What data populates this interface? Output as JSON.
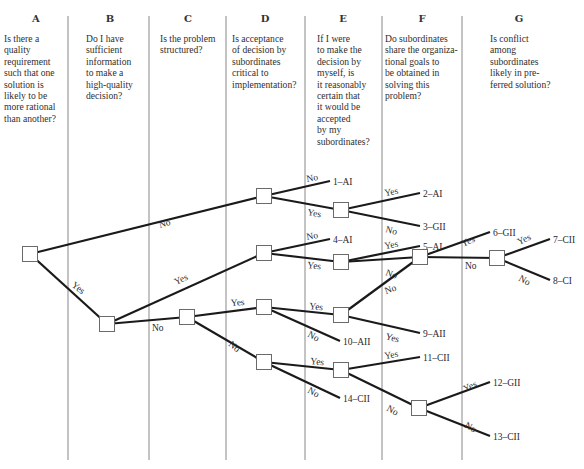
{
  "columns": [
    {
      "letter": "A",
      "question": "Is there a\nquality\nrequirement\nsuch that one\nsolution is\nlikely to be\nmore rational\nthan another?",
      "x": 4,
      "w": 64,
      "cx": 36
    },
    {
      "letter": "B",
      "question": "Do I have\nsufficient\ninformation\nto make a\nhigh-quality\ndecision?",
      "x": 86,
      "w": 62,
      "cx": 110
    },
    {
      "letter": "C",
      "question": "Is the problem\nstructured?",
      "x": 160,
      "w": 66,
      "cx": 188
    },
    {
      "letter": "D",
      "question": "Is acceptance\nof decision by\nsubordinates\ncritical to\nimplementation?",
      "x": 232,
      "w": 72,
      "cx": 265
    },
    {
      "letter": "E",
      "question": "If I were\nto make the\ndecision by\nmyself, is\nit reasonably\ncertain that\nit would be\naccepted\nby my\nsubordinates?",
      "x": 317,
      "w": 64,
      "cx": 343
    },
    {
      "letter": "F",
      "question": "Do subordinates\nshare the organiza-\ntional goals to\nbe obtained in\nsolving this\nproblem?",
      "x": 385,
      "w": 76,
      "cx": 422
    },
    {
      "letter": "G",
      "question": "Is conflict\namong\nsubordinates\nlikely in pre-\nferred solution?",
      "x": 490,
      "w": 90,
      "cx": 519
    }
  ],
  "dividers": [
    68,
    149,
    226,
    305,
    382,
    462
  ],
  "nodes": [
    {
      "id": "A",
      "x": 30,
      "y": 254
    },
    {
      "id": "B",
      "x": 107,
      "y": 324
    },
    {
      "id": "C",
      "x": 187,
      "y": 317
    },
    {
      "id": "D1",
      "x": 264,
      "y": 196
    },
    {
      "id": "D2",
      "x": 264,
      "y": 253
    },
    {
      "id": "D3",
      "x": 264,
      "y": 307
    },
    {
      "id": "D4",
      "x": 264,
      "y": 362
    },
    {
      "id": "E1",
      "x": 341,
      "y": 210
    },
    {
      "id": "E2",
      "x": 341,
      "y": 262
    },
    {
      "id": "E3",
      "x": 341,
      "y": 315
    },
    {
      "id": "E4",
      "x": 341,
      "y": 370
    },
    {
      "id": "F1",
      "x": 420,
      "y": 257
    },
    {
      "id": "F2",
      "x": 419,
      "y": 408
    },
    {
      "id": "G",
      "x": 497,
      "y": 258
    }
  ],
  "edges": [
    {
      "from": "A",
      "to": "D1",
      "label": "No",
      "lx": 160,
      "ly": 228,
      "rot": -17
    },
    {
      "from": "A",
      "to": "B",
      "label": "Yes",
      "lx": 71,
      "ly": 286,
      "rot": 38
    },
    {
      "from": "B",
      "to": "D2",
      "label": "Yes",
      "lx": 176,
      "ly": 285,
      "rot": -25
    },
    {
      "from": "B",
      "to": "C",
      "label": "No",
      "lx": 152,
      "ly": 331,
      "rot": 0
    },
    {
      "from": "C",
      "to": "D3",
      "label": "Yes",
      "lx": 231,
      "ly": 306,
      "rot": -4
    },
    {
      "from": "C",
      "to": "D4",
      "label": "No",
      "lx": 228,
      "ly": 345,
      "rot": 40
    },
    {
      "from": "D3",
      "to": "E3",
      "label": "Yes",
      "lx": 309,
      "ly": 309,
      "rot": 6
    },
    {
      "from": "D1",
      "to": "E1",
      "label": "Yes",
      "lx": 307,
      "ly": 215,
      "rot": 10
    },
    {
      "from": "D2",
      "to": "E2",
      "label": "Yes",
      "lx": 307,
      "ly": 268,
      "rot": 6
    },
    {
      "from": "D4",
      "to": "E4",
      "label": "Yes",
      "lx": 310,
      "ly": 364,
      "rot": 6
    },
    {
      "from": "E1",
      "to": "F1",
      "label": "",
      "lx": 0,
      "ly": 0,
      "rot": 0,
      "skip": true
    },
    {
      "from": "E2",
      "to": "F1",
      "label": "No",
      "lx": 385,
      "ly": 275,
      "rot": 20
    },
    {
      "from": "E3",
      "to": "F1",
      "label": "No",
      "lx": 386,
      "ly": 294,
      "rot": -20
    },
    {
      "from": "E4",
      "to": "F2",
      "label": "No",
      "lx": 386,
      "ly": 410,
      "rot": 30
    },
    {
      "from": "F1",
      "to": "G",
      "label": "No",
      "lx": 465,
      "ly": 269,
      "rot": 0
    }
  ],
  "outcome_edges": [
    {
      "from": "D1",
      "tx": 330,
      "ty": 181,
      "label": "No",
      "lx": 307,
      "ly": 182,
      "rot": -10,
      "outcome": "1–AI"
    },
    {
      "from": "D2",
      "tx": 330,
      "ty": 239,
      "label": "No",
      "lx": 307,
      "ly": 240,
      "rot": -10,
      "outcome": "4–AI"
    },
    {
      "from": "D3",
      "tx": 340,
      "ty": 341,
      "label": "No",
      "lx": 307,
      "ly": 336,
      "rot": 30,
      "outcome": "10–AII"
    },
    {
      "from": "D4",
      "tx": 340,
      "ty": 398,
      "label": "No",
      "lx": 307,
      "ly": 392,
      "rot": 30,
      "outcome": "14–CII"
    },
    {
      "from": "E1",
      "tx": 420,
      "ty": 193,
      "label": "Yes",
      "lx": 385,
      "ly": 196,
      "rot": -10,
      "outcome": "2–AI"
    },
    {
      "from": "E1",
      "tx": 420,
      "ty": 226,
      "label": "No",
      "lx": 385,
      "ly": 232,
      "rot": 15,
      "outcome": "3–GII"
    },
    {
      "from": "E2",
      "tx": 420,
      "ty": 246,
      "label": "Yes",
      "lx": 385,
      "ly": 249,
      "rot": -10,
      "outcome": "5–AI"
    },
    {
      "from": "E3",
      "tx": 420,
      "ty": 333,
      "label": "Yes",
      "lx": 385,
      "ly": 339,
      "rot": 15,
      "outcome": "9–AII"
    },
    {
      "from": "E4",
      "tx": 420,
      "ty": 357,
      "label": "Yes",
      "lx": 385,
      "ly": 359,
      "rot": -10,
      "outcome": "11–CII"
    },
    {
      "from": "F1",
      "tx": 490,
      "ty": 232,
      "label": "Yes",
      "lx": 463,
      "ly": 247,
      "rot": -25,
      "outcome": "6–GII"
    },
    {
      "from": "F2",
      "tx": 490,
      "ty": 382,
      "label": "Yes",
      "lx": 465,
      "ly": 392,
      "rot": -25,
      "outcome": "12–GII"
    },
    {
      "from": "F2",
      "tx": 490,
      "ty": 436,
      "label": "No",
      "lx": 464,
      "ly": 427,
      "rot": 30,
      "outcome": "13–CII"
    },
    {
      "from": "G",
      "tx": 550,
      "ty": 239,
      "label": "Yes",
      "lx": 519,
      "ly": 245,
      "rot": -25,
      "outcome": "7–CII"
    },
    {
      "from": "G",
      "tx": 550,
      "ty": 280,
      "label": "No",
      "lx": 518,
      "ly": 280,
      "rot": 30,
      "outcome": "8–CI"
    }
  ]
}
